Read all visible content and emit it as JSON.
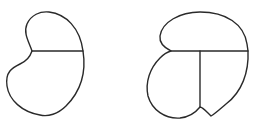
{
  "figure": {
    "stroke_color": "#2a2a2a",
    "background": "#ffffff",
    "shapes": [
      {
        "id": "left-shape",
        "divisions": 2,
        "internal_lines": [
          "horizontal"
        ]
      },
      {
        "id": "right-shape",
        "divisions": 3,
        "internal_lines": [
          "horizontal",
          "vertical"
        ]
      }
    ]
  }
}
